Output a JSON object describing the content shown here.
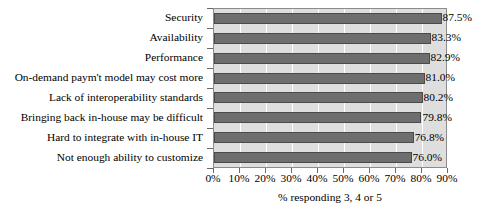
{
  "chart_data": {
    "type": "bar",
    "orientation": "horizontal",
    "title": "",
    "xlabel": "% responding 3, 4 or 5",
    "ylabel": "",
    "xlim": [
      0,
      90
    ],
    "xtick_labels": [
      "0%",
      "10%",
      "20%",
      "30%",
      "40%",
      "50%",
      "60%",
      "70%",
      "80%",
      "90%"
    ],
    "xticks": [
      0,
      10,
      20,
      30,
      40,
      50,
      60,
      70,
      80,
      90
    ],
    "grid": true,
    "legend": "none",
    "categories": [
      "Security",
      "Availability",
      "Performance",
      "On-demand paym't model may cost more",
      "Lack of interoperability standards",
      "Bringing back in-house may be difficult",
      "Hard to integrate with in-house IT",
      "Not enough ability to customize"
    ],
    "values": [
      87.5,
      83.3,
      82.9,
      81.0,
      80.2,
      79.8,
      76.8,
      76.0
    ],
    "value_labels": [
      "87.5%",
      "83.3%",
      "82.9%",
      "81.0%",
      "80.2%",
      "79.8%",
      "76.8%",
      "76.0%"
    ],
    "colors": {
      "bar_fill": "#6e6e6e",
      "bar_border": "#4a4a4a",
      "plot_background": "#dedede",
      "plot_border": "#8c8c8c",
      "gridline": "#ffffff",
      "text": "#000000",
      "page_background": "#ffffff"
    }
  }
}
